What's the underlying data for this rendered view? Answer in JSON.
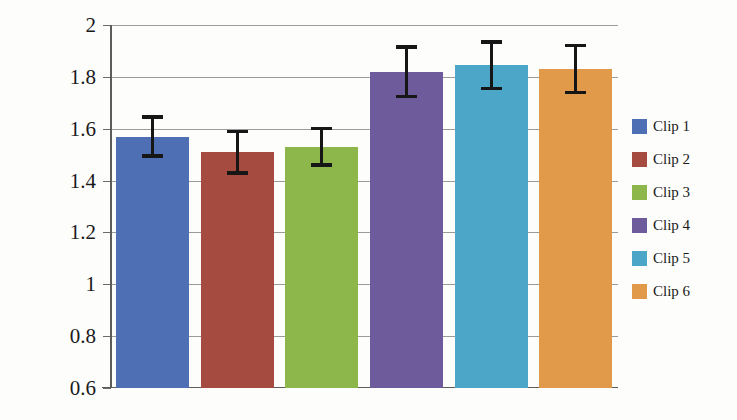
{
  "chart_data": {
    "type": "bar",
    "title": "",
    "xlabel": "",
    "ylabel": "DFA Scaling Exponent",
    "categories": [
      "Clip 1",
      "Clip 2",
      "Clip 3",
      "Clip 4",
      "Clip 5",
      "Clip 6"
    ],
    "values": [
      1.57,
      1.51,
      1.53,
      1.82,
      1.845,
      1.83
    ],
    "errors": [
      0.075,
      0.08,
      0.07,
      0.095,
      0.09,
      0.09
    ],
    "ylim": [
      0.6,
      2.0
    ],
    "yticks": [
      0.6,
      0.8,
      1.0,
      1.2,
      1.4,
      1.6,
      1.8,
      2.0
    ],
    "ytick_labels": [
      "0.6",
      "0.8",
      "1",
      "1.2",
      "1.4",
      "1.6",
      "1.8",
      "2"
    ],
    "xtick_labels": [],
    "grid": true,
    "legend_position": "right",
    "error_bar_style": "capped",
    "series": [
      {
        "name": "Clip 1",
        "value": 1.57,
        "error": 0.075,
        "error_low": 1.495,
        "error_high": 1.645,
        "color": "#4F6FB5"
      },
      {
        "name": "Clip 2",
        "value": 1.51,
        "error": 0.08,
        "error_low": 1.43,
        "error_high": 1.59,
        "color": "#A64B3F"
      },
      {
        "name": "Clip 3",
        "value": 1.53,
        "error": 0.07,
        "error_low": 1.46,
        "error_high": 1.6,
        "color": "#8EB74B"
      },
      {
        "name": "Clip 4",
        "value": 1.82,
        "error": 0.095,
        "error_low": 1.725,
        "error_high": 1.915,
        "color": "#6E5B9B"
      },
      {
        "name": "Clip 5",
        "value": 1.845,
        "error": 0.09,
        "error_low": 1.755,
        "error_high": 1.935,
        "color": "#4BA6C8"
      },
      {
        "name": "Clip 6",
        "value": 1.83,
        "error": 0.09,
        "error_low": 1.74,
        "error_high": 1.92,
        "color": "#E09A49"
      }
    ]
  },
  "legend": {
    "items": [
      {
        "label": "Clip 1",
        "color": "#4F6FB5"
      },
      {
        "label": "Clip 2",
        "color": "#A64B3F"
      },
      {
        "label": "Clip 3",
        "color": "#8EB74B"
      },
      {
        "label": "Clip 4",
        "color": "#6E5B9B"
      },
      {
        "label": "Clip 5",
        "color": "#4BA6C8"
      },
      {
        "label": "Clip 6",
        "color": "#E09A49"
      }
    ]
  },
  "colors": {
    "gridline": "#9a9a9a",
    "axis": "#5c5c5c",
    "error_bar": "#161616",
    "text": "#1a1a1a",
    "background": "#fdfdfc"
  }
}
